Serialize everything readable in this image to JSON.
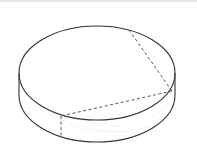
{
  "figure": {
    "colors": {
      "background": "#ffffff",
      "stroke": "#333333",
      "dashed": "#444444",
      "shading": "#bbbbbb",
      "top_rule": "#e6e6e6"
    },
    "geometry": {
      "top_ellipse": {
        "cx": 97,
        "cy": 73,
        "rx": 78,
        "ry": 47
      },
      "height": 22,
      "top_point": [
        129,
        30
      ],
      "right_point": [
        172,
        91
      ],
      "left_front_point": [
        61,
        116
      ],
      "left_front_bottom": [
        61,
        137
      ]
    }
  }
}
